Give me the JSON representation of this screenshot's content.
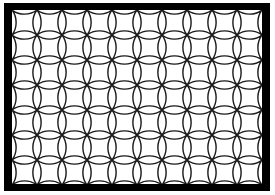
{
  "artwork": {
    "title": "Tessellation Pattern Plate",
    "type": "geometric-tiling",
    "canvas": {
      "width": 275,
      "height": 195,
      "background_color": "#ffffff"
    },
    "frame": {
      "name": "black-rectangular-border",
      "color": "#000000",
      "outer": {
        "x": 4,
        "y": 3,
        "width": 266,
        "height": 188
      },
      "inner": {
        "x": 12,
        "y": 10,
        "width": 250,
        "height": 174
      },
      "thickness_px": 8
    },
    "field": {
      "name": "tiling-field",
      "background_color": "#ffffff",
      "x": 12,
      "y": 10,
      "width": 250,
      "height": 174
    },
    "tiles": {
      "shape_name": "bone-tile",
      "description": "Curved H-shaped / bone-shaped quadrilateral tile with concave waisted sides and convex lobed ends",
      "line_color": "#1a1a1a",
      "line_width": 1.4,
      "unit_size_px": 25,
      "columns": 10,
      "rows": 7,
      "arrangement": "pinwheel",
      "rotation_sequence_deg": [
        0,
        90,
        0,
        90
      ],
      "fill_color": "#ffffff"
    }
  }
}
